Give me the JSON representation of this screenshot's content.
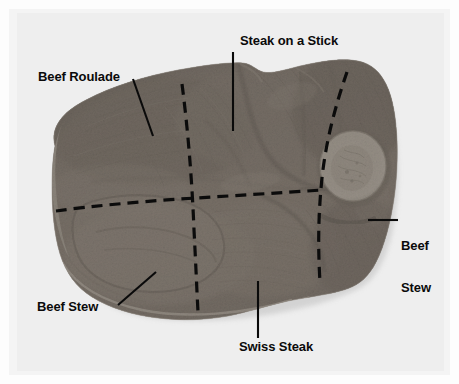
{
  "figure": {
    "kind": "meat-cut-diagram-photograph",
    "background_color": "#f2f2f2",
    "frame_color": "#fdfdfd",
    "plate_color": "#eeeeee",
    "line_color": "#0a0a0a"
  },
  "labels": [
    {
      "id": "steak-on-a-stick",
      "text": "Steak on a Stick",
      "x": 240,
      "y": 34
    },
    {
      "id": "beef-roulade",
      "text": "Beef Roulade",
      "x": 38,
      "y": 70
    },
    {
      "id": "beef-stew-right",
      "text": "Beef\nStew",
      "line1": "Beef",
      "line2": "Stew",
      "x": 401,
      "y": 211
    },
    {
      "id": "beef-stew-left",
      "text": "Beef Stew",
      "x": 37,
      "y": 300
    },
    {
      "id": "swiss-steak",
      "text": "Swiss Steak",
      "x": 239,
      "y": 340
    }
  ],
  "leaders": [
    {
      "id": "leader-beef-roulade",
      "from": [
        133,
        79
      ],
      "to": [
        153,
        136
      ]
    },
    {
      "id": "leader-steak-on-a-stick",
      "from": [
        233,
        52
      ],
      "to": [
        233,
        131
      ]
    },
    {
      "id": "leader-beef-stew-right",
      "from": [
        398,
        220
      ],
      "to": [
        368,
        220
      ]
    },
    {
      "id": "leader-beef-stew-left",
      "from": [
        118,
        305
      ],
      "to": [
        156,
        272
      ]
    },
    {
      "id": "leader-swiss-steak",
      "from": [
        258,
        338
      ],
      "to": [
        258,
        281
      ]
    }
  ],
  "cut_lines": [
    {
      "id": "cut-vertical-left",
      "style": "dashed"
    },
    {
      "id": "cut-horizontal",
      "style": "dashed"
    },
    {
      "id": "cut-vertical-right",
      "style": "dashed"
    }
  ],
  "regions": [
    "Beef Roulade",
    "Steak on a Stick",
    "Swiss Steak",
    "Beef Stew"
  ]
}
